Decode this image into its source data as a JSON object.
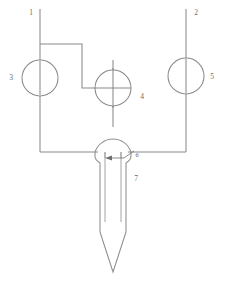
{
  "diagram": {
    "background_color": "#ffffff",
    "line_color": "#8a8a8a",
    "label_color": "#6b6b6b",
    "labels": [
      {
        "id": "callout-1",
        "text": "1",
        "x": 31,
        "y": 15
      },
      {
        "id": "callout-2",
        "text": "2",
        "x": 196,
        "y": 15
      },
      {
        "id": "callout-3",
        "text": "3",
        "x": 11,
        "y": 80
      },
      {
        "id": "callout-4",
        "text": "4",
        "x": 142,
        "y": 99
      },
      {
        "id": "callout-5",
        "text": "5",
        "x": 212,
        "y": 79
      },
      {
        "id": "callout-6",
        "text": "6",
        "x": 137,
        "y": 157
      },
      {
        "id": "callout-7",
        "text": "7",
        "x": 136,
        "y": 181
      }
    ],
    "symbols": [
      {
        "id": "gauge-3",
        "shape": "circle",
        "cx": 40,
        "cy": 78,
        "r": 18,
        "marking": "vertical-bar"
      },
      {
        "id": "gauge-4",
        "shape": "circle",
        "cx": 113,
        "cy": 88,
        "r": 18,
        "marking": "cross-bar"
      },
      {
        "id": "gauge-5",
        "shape": "circle",
        "cx": 186,
        "cy": 76,
        "r": 18,
        "marking": "vertical-bar"
      }
    ],
    "ports": [
      {
        "id": "port-1",
        "label": "1",
        "x": 40,
        "y_top": 8
      },
      {
        "id": "port-2",
        "label": "2",
        "x": 186,
        "y_top": 8
      }
    ],
    "dimension": {
      "id": "gap-dimension-6",
      "label": "6",
      "arrow_from_x": 130,
      "arrow_to_x": 110,
      "y": 155
    },
    "nozzle": {
      "id": "nozzle-body",
      "label": "7",
      "bulb_cx": 113,
      "bulb_top_y": 126,
      "bulb_radius": 19,
      "shank_left_x": 100,
      "shank_right_x": 126,
      "tip_y": 272,
      "taper_start_y": 232,
      "inner_channel_left_x": 105,
      "inner_channel_right_x": 121,
      "inner_channel_end_y": 222
    }
  }
}
